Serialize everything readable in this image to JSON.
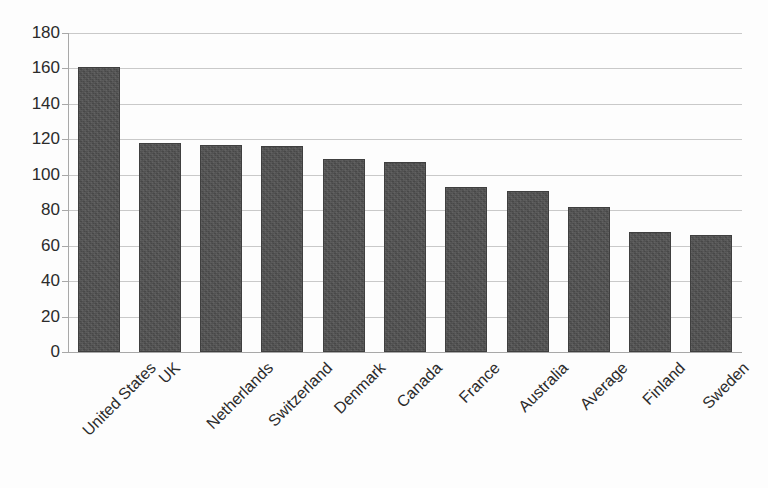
{
  "chart_data": {
    "type": "bar",
    "title": "",
    "subtitle": "",
    "xlabel": "",
    "ylabel": "",
    "categories": [
      "United States",
      "UK",
      "Netherlands",
      "Switzerland",
      "Denmark",
      "Canada",
      "France",
      "Australia",
      "Average",
      "Finland",
      "Sweden"
    ],
    "values": [
      161,
      118,
      117,
      116,
      109,
      107,
      93,
      91,
      82,
      68,
      66
    ],
    "ylim": [
      0,
      180
    ],
    "ytick_step": 20,
    "ytick_labels": [
      "180",
      "160",
      "140",
      "120",
      "100",
      "80",
      "60",
      "40",
      "20",
      "0"
    ],
    "ytick_values": [
      180,
      160,
      140,
      120,
      100,
      80,
      60,
      40,
      20,
      0
    ],
    "grid": true,
    "grid_axis": "y",
    "legend": false,
    "legend_position": "none",
    "annotations": [],
    "series": [
      {
        "name": "",
        "values": [
          161,
          118,
          117,
          116,
          109,
          107,
          93,
          91,
          82,
          68,
          66
        ]
      }
    ]
  },
  "style": {
    "bar_color": "#4c4c4c",
    "bar_border_color": "#3f3f3f",
    "gridline_color": "#c9c9c9",
    "axis_color": "#a8a8a8",
    "text_color": "#2b2b2b",
    "background_color": "#fdfdfd",
    "x_label_rotation_degrees": "-45"
  }
}
